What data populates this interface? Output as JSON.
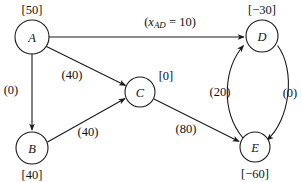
{
  "diagram": {
    "type": "network-flow-graph",
    "nodes": [
      {
        "id": "A",
        "label": "A",
        "supply": "[50]",
        "cx": 32,
        "cy": 37,
        "r": 17,
        "supply_x": 32,
        "supply_y": 10
      },
      {
        "id": "B",
        "label": "B",
        "supply": "[40]",
        "cx": 32,
        "cy": 148,
        "r": 16,
        "supply_x": 32,
        "supply_y": 175
      },
      {
        "id": "C",
        "label": "C",
        "supply": "[0]",
        "cx": 140,
        "cy": 92,
        "r": 15,
        "supply_x": 166,
        "supply_y": 76
      },
      {
        "id": "D",
        "label": "D",
        "supply": "[−30]",
        "cx": 262,
        "cy": 36,
        "r": 16,
        "supply_x": 262,
        "supply_y": 10
      },
      {
        "id": "E",
        "label": "E",
        "supply": "[−60]",
        "cx": 255,
        "cy": 147,
        "r": 15,
        "supply_x": 255,
        "supply_y": 174
      }
    ],
    "edges": [
      {
        "from": "A",
        "to": "D",
        "label": "",
        "flow_label": "(x_AD = 10)",
        "flow_var": "x",
        "flow_sub": "AD",
        "flow_eq": " = 10)",
        "flow_open": "(",
        "label_x": 170,
        "label_y": 22
      },
      {
        "from": "A",
        "to": "C",
        "label": "(40)",
        "label_x": 72,
        "label_y": 75
      },
      {
        "from": "A",
        "to": "B",
        "label": "(0)",
        "label_x": 11,
        "label_y": 90
      },
      {
        "from": "B",
        "to": "C",
        "label": "(40)",
        "label_x": 88,
        "label_y": 132
      },
      {
        "from": "C",
        "to": "E",
        "label": "(80)",
        "label_x": 186,
        "label_y": 129
      },
      {
        "from": "E",
        "to": "D",
        "label": "(20)",
        "label_x": 220,
        "label_y": 92
      },
      {
        "from": "D",
        "to": "E",
        "label": "(0)",
        "label_x": 290,
        "label_y": 93
      }
    ],
    "colors": {
      "stroke": "#1a1a1a",
      "text": "#111111",
      "node_fill": "#ffffff",
      "background": "#ffffff"
    }
  }
}
